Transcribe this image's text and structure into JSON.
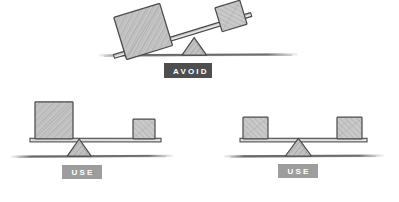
{
  "illustration": {
    "title": "Balance and visual weight sketch",
    "style": "hand-drawn pencil sketch",
    "background_color": "#ffffff",
    "sketch_stroke_color": "#3d3d3d",
    "shading_fill_color": "#bcbcbc",
    "ground_color": "#6b6b6b"
  },
  "badges": {
    "avoid": {
      "label": "AVOID",
      "background_color": "#4e4e4e",
      "text_color": "#ffffff"
    },
    "use_left": {
      "label": "USE",
      "background_color": "#9d9d9d",
      "text_color": "#ffffff"
    },
    "use_right": {
      "label": "USE",
      "background_color": "#9d9d9d",
      "text_color": "#ffffff"
    }
  },
  "scenes": [
    {
      "id": "scene-avoid",
      "verdict": "AVOID",
      "description": "Unbalanced seesaw: heavy large square resting on ground at left, light small square lifted high at right",
      "balanced": false,
      "plank_tilt_degrees": -17,
      "fulcrum": {
        "center_x": 194,
        "base_y": 55,
        "half_width": 12,
        "height": 17,
        "position": "right of center"
      },
      "ground": {
        "x1": 100,
        "x2": 295,
        "y": 55
      },
      "blocks": [
        {
          "name": "large-block",
          "side": "left",
          "size": "large",
          "width": 48,
          "height": 44,
          "center_x": 143,
          "center_y": 31,
          "rotation_degrees": -17,
          "state": "resting on ground"
        },
        {
          "name": "small-block",
          "side": "right",
          "size": "small",
          "width": 26,
          "height": 25,
          "center_x": 231,
          "center_y": 16,
          "rotation_degrees": -17,
          "state": "lifted up"
        }
      ]
    },
    {
      "id": "scene-use-lever",
      "verdict": "USE",
      "description": "Balanced seesaw: large heavy square at far left balanced by small square at far right, fulcrum shifted toward the heavy side",
      "balanced": true,
      "plank_tilt_degrees": 0,
      "fulcrum": {
        "center_x": 79,
        "base_y": 156,
        "half_width": 12,
        "height": 17,
        "position": "offset toward heavy block"
      },
      "ground": {
        "x1": 12,
        "x2": 172,
        "y": 156
      },
      "blocks": [
        {
          "name": "large-block",
          "side": "left",
          "size": "large",
          "width": 38,
          "height": 37,
          "left": 35,
          "top": 102,
          "rotation_degrees": 0,
          "state": "on plank"
        },
        {
          "name": "small-block",
          "side": "right",
          "size": "small",
          "width": 22,
          "height": 20,
          "left": 133,
          "top": 119,
          "rotation_degrees": 0,
          "state": "on plank"
        }
      ],
      "plank": {
        "x1": 30,
        "x2": 160,
        "y": 139
      }
    },
    {
      "id": "scene-use-equal",
      "verdict": "USE",
      "description": "Balanced seesaw: two equal small squares at both ends with a centered fulcrum",
      "balanced": true,
      "plank_tilt_degrees": 0,
      "fulcrum": {
        "center_x": 298,
        "base_y": 156,
        "half_width": 13,
        "height": 18,
        "position": "centered"
      },
      "ground": {
        "x1": 225,
        "x2": 382,
        "y": 156
      },
      "blocks": [
        {
          "name": "small-block-left",
          "side": "left",
          "size": "small",
          "width": 25,
          "height": 22,
          "left": 243,
          "top": 117,
          "rotation_degrees": 0,
          "state": "on plank"
        },
        {
          "name": "small-block-right",
          "side": "right",
          "size": "small",
          "width": 25,
          "height": 22,
          "left": 337,
          "top": 117,
          "rotation_degrees": 0,
          "state": "on plank"
        }
      ],
      "plank": {
        "x1": 240,
        "x2": 366,
        "y": 139
      }
    }
  ]
}
